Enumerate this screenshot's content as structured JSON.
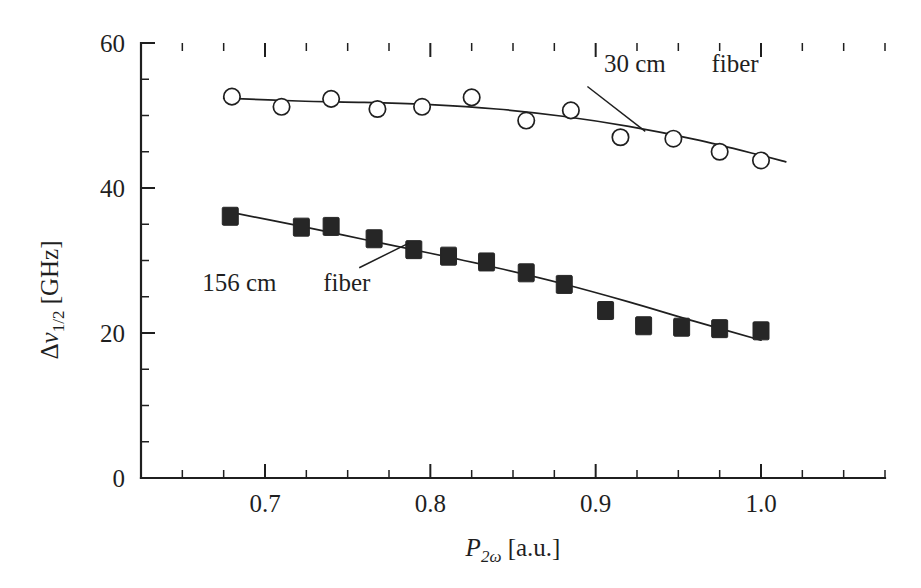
{
  "chart_data": {
    "type": "scatter",
    "title": "",
    "subtitle": "",
    "xlabel": "P_2w [a.u.]",
    "ylabel": "Delta nu_1/2 [GHz]",
    "xlim": [
      0.625,
      1.075
    ],
    "ylim": [
      0,
      60
    ],
    "grid": false,
    "legend_position": "inline-annotation",
    "x_ticks": [
      0.7,
      0.8,
      0.9,
      1.0
    ],
    "x_tick_labels": [
      "0.7",
      "0.8",
      "0.9",
      "1.0"
    ],
    "x_minor_step": 0.025,
    "y_ticks": [
      0,
      20,
      40,
      60
    ],
    "y_tick_labels": [
      "0",
      "20",
      "40",
      "60"
    ],
    "y_minor_step": 5,
    "series": [
      {
        "name": "30 cm fiber",
        "marker": "open-circle",
        "x": [
          0.68,
          0.71,
          0.74,
          0.768,
          0.795,
          0.825,
          0.858,
          0.885,
          0.915,
          0.947,
          0.975,
          1.0
        ],
        "values": [
          52.6,
          51.2,
          52.3,
          50.9,
          51.2,
          52.5,
          49.3,
          50.7,
          47.0,
          46.8,
          45.0,
          43.8
        ],
        "fit": {
          "x": [
            0.675,
            0.72,
            0.76,
            0.8,
            0.84,
            0.88,
            0.92,
            0.96,
            1.0,
            1.015
          ],
          "y": [
            52.4,
            52.0,
            51.8,
            51.5,
            50.9,
            49.9,
            48.5,
            46.7,
            44.5,
            43.6
          ]
        }
      },
      {
        "name": "156 cm fiber",
        "marker": "filled-square",
        "x": [
          0.679,
          0.722,
          0.74,
          0.766,
          0.79,
          0.811,
          0.834,
          0.858,
          0.881,
          0.906,
          0.929,
          0.952,
          0.975,
          1.0
        ],
        "values": [
          36.1,
          34.6,
          34.7,
          33.0,
          31.5,
          30.6,
          29.8,
          28.3,
          26.7,
          23.1,
          21.0,
          20.8,
          20.6,
          20.3
        ],
        "fit": {
          "x": [
            0.676,
            0.72,
            0.76,
            0.8,
            0.84,
            0.88,
            0.92,
            0.96,
            1.0
          ],
          "y": [
            36.8,
            34.8,
            32.9,
            31.0,
            29.0,
            26.8,
            24.3,
            21.6,
            19.0
          ]
        }
      }
    ],
    "annotations": [
      {
        "name": "annotation-30cm",
        "text_main": "30 cm",
        "text_secondary": "fiber",
        "text_x": 0.905,
        "text_y": 56.0,
        "leader_from": [
          0.895,
          54.0
        ],
        "leader_to": [
          0.93,
          47.8
        ]
      },
      {
        "name": "annotation-156cm",
        "text_main": "156 cm",
        "text_secondary": "fiber",
        "text_x": 0.662,
        "text_y": 25.8,
        "leader_from": [
          0.757,
          29.0
        ],
        "leader_to": [
          0.787,
          32.4
        ]
      }
    ]
  },
  "axes": {
    "x_label_parts": {
      "symbol": "P",
      "subscript": "2ω",
      "unit": "[a.u.]"
    },
    "y_label_parts": {
      "delta": "Δ",
      "symbol": "ν",
      "subscript": "1/2",
      "unit": "[GHz]"
    }
  },
  "colors": {
    "ink": "#1f1f1f",
    "marker_fill": "#262626",
    "background": "#ffffff"
  }
}
